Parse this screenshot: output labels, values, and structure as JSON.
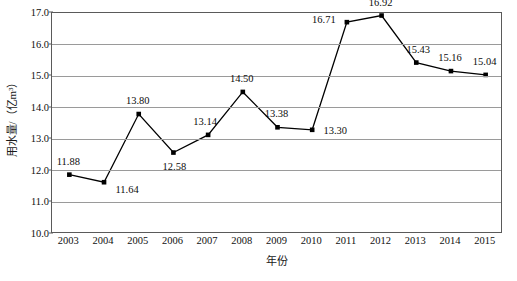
{
  "chart_data": {
    "type": "line",
    "title": "",
    "xlabel": "年份",
    "ylabel": "用水量/（亿m³）",
    "categories": [
      "2003",
      "2004",
      "2005",
      "2006",
      "2007",
      "2008",
      "2009",
      "2010",
      "2011",
      "2012",
      "2013",
      "2014",
      "2015"
    ],
    "values": [
      11.88,
      11.64,
      13.8,
      12.58,
      13.14,
      14.5,
      13.38,
      13.3,
      16.71,
      16.92,
      15.43,
      15.16,
      15.04
    ],
    "value_labels": [
      "11.88",
      "11.64",
      "13.80",
      "12.58",
      "13.14",
      "14.50",
      "13.38",
      "13.30",
      "16.71",
      "16.92",
      "15.43",
      "15.16",
      "15.04"
    ],
    "ylim": [
      10.0,
      17.0
    ],
    "ytick_labels": [
      "17.0",
      "16.0",
      "15.0",
      "14.0",
      "13.0",
      "12.0",
      "11.0",
      "10.0"
    ],
    "ytick_values": [
      17.0,
      16.0,
      15.0,
      14.0,
      13.0,
      12.0,
      11.0,
      10.0
    ],
    "grid": true,
    "legend": "none",
    "series_color": "#000000",
    "grid_color": "#9a9a9a",
    "axis_color": "#5a5a5a",
    "marker": "square"
  },
  "label_offsets": [
    {
      "dx": 0,
      "dy": -13
    },
    {
      "dx": 24,
      "dy": 8
    },
    {
      "dx": 0,
      "dy": -13
    },
    {
      "dx": 2,
      "dy": 14
    },
    {
      "dx": -2,
      "dy": -13
    },
    {
      "dx": 0,
      "dy": -13
    },
    {
      "dx": 0,
      "dy": -13
    },
    {
      "dx": 24,
      "dy": 1
    },
    {
      "dx": -22,
      "dy": -2
    },
    {
      "dx": 0,
      "dy": -13
    },
    {
      "dx": 3,
      "dy": -13
    },
    {
      "dx": 0,
      "dy": -13
    },
    {
      "dx": 0,
      "dy": -13
    }
  ]
}
